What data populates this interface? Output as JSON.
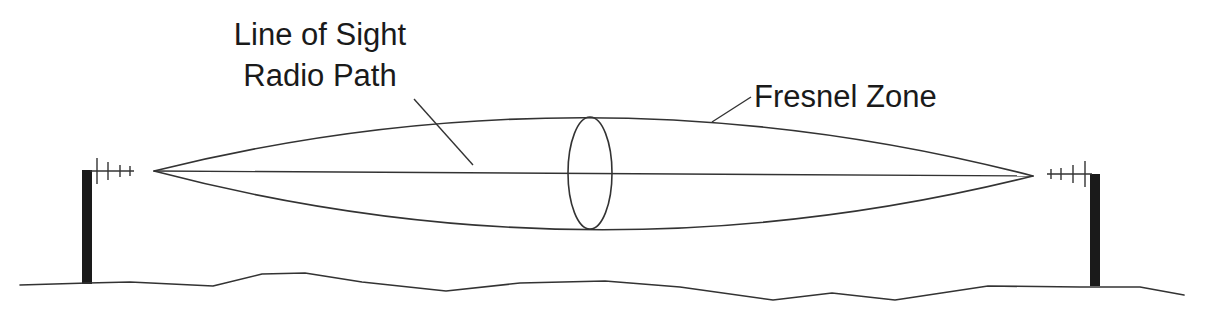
{
  "diagram": {
    "labels": {
      "los_line1": "Line of Sight",
      "los_line2": "Radio Path",
      "fresnel": "Fresnel Zone"
    },
    "elements": [
      {
        "id": "left-antenna-mast",
        "type": "tower with yagi antenna"
      },
      {
        "id": "right-antenna-mast",
        "type": "tower with yagi antenna"
      },
      {
        "id": "line-of-sight-path",
        "type": "straight line between antennas"
      },
      {
        "id": "fresnel-zone",
        "type": "ellipsoid lens around path"
      },
      {
        "id": "fresnel-cross-section",
        "type": "ellipse at midpoint"
      },
      {
        "id": "ground-terrain",
        "type": "irregular terrain line"
      }
    ],
    "colors": {
      "line": "#333333",
      "text": "#1a1a1a",
      "mast": "#1a1a1a",
      "background": "#ffffff"
    }
  }
}
